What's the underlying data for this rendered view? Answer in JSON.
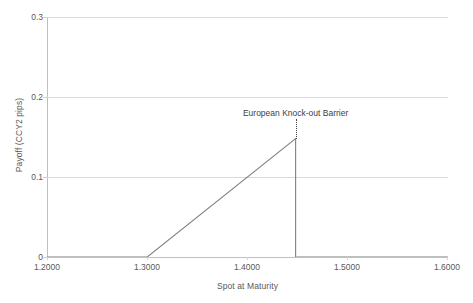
{
  "chart_data": {
    "type": "line",
    "title": "",
    "xlabel": "Spot at Maturity",
    "ylabel": "Payoff (CCY2 pips)",
    "xlim": [
      1.2,
      1.6
    ],
    "ylim": [
      0,
      0.3
    ],
    "xticks": [
      "1.2000",
      "1.3000",
      "1.4000",
      "1.5000",
      "1.6000"
    ],
    "xtick_values": [
      1.2,
      1.3,
      1.4,
      1.5,
      1.6
    ],
    "yticks": [
      "0",
      "0.1",
      "0.2",
      "0.3"
    ],
    "ytick_values": [
      0,
      0.1,
      0.2,
      0.3
    ],
    "grid": true,
    "legend": "none",
    "series": [
      {
        "name": "Payoff",
        "color": "#808080",
        "points": [
          {
            "x": 1.2,
            "y": 0.0
          },
          {
            "x": 1.3,
            "y": 0.0
          },
          {
            "x": 1.448,
            "y": 0.148
          },
          {
            "x": 1.448,
            "y": 0.0
          },
          {
            "x": 1.6,
            "y": 0.0
          }
        ]
      }
    ],
    "annotations": [
      {
        "text": "European Knock-out Barrier",
        "x": 1.448,
        "y": 0.3,
        "leader": "dotted",
        "color": "#404040"
      }
    ]
  },
  "axes": {
    "y_title": "Payoff (CCY2 pips)",
    "x_title": "Spot at Maturity",
    "y_labels": [
      "0.3",
      "0.2",
      "0.1",
      "0"
    ],
    "x_labels": [
      "1.2000",
      "1.3000",
      "1.4000",
      "1.5000",
      "1.6000"
    ]
  },
  "annotation": {
    "barrier_label": "European Knock-out Barrier"
  },
  "colors": {
    "series": "#808080",
    "gridline": "#d9d9d9",
    "axis": "#bfbfbf",
    "text": "#595959",
    "annotation_text": "#404040",
    "background": "#ffffff"
  }
}
